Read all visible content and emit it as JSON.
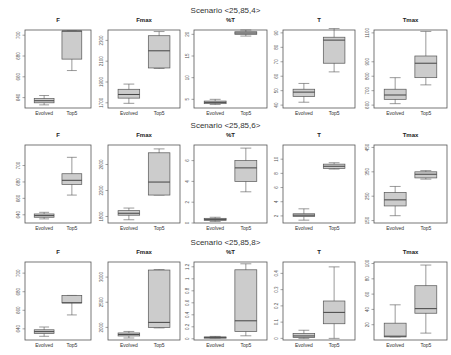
{
  "chart_data": [
    {
      "scenario": "Scenario <25,85,4>",
      "panels": [
        {
          "title": "F",
          "type": "box",
          "categories": [
            "Evolved",
            "Top5"
          ],
          "ylim": [
            630,
            705
          ],
          "yticks": [
            640,
            660,
            680,
            700
          ],
          "boxes": [
            {
              "min": 633,
              "q1": 635,
              "median": 637,
              "q3": 639,
              "max": 642
            },
            {
              "min": 666,
              "q1": 677,
              "median": 704,
              "q3": 704,
              "max": 704
            }
          ]
        },
        {
          "title": "Fmax",
          "type": "box",
          "categories": [
            "Evolved",
            "Top5"
          ],
          "ylim": [
            1650,
            2400
          ],
          "yticks": [
            1700,
            1900,
            2100,
            2300
          ],
          "boxes": [
            {
              "min": 1695,
              "q1": 1745,
              "median": 1780,
              "q3": 1830,
              "max": 1880
            },
            {
              "min": 2030,
              "q1": 2035,
              "median": 2200,
              "q3": 2345,
              "max": 2385
            }
          ]
        },
        {
          "title": "%T",
          "type": "box",
          "categories": [
            "Evolved",
            "Top5"
          ],
          "ylim": [
            3,
            21
          ],
          "yticks": [
            5,
            10,
            15,
            20
          ],
          "boxes": [
            {
              "min": 3.8,
              "q1": 4.0,
              "median": 4.3,
              "q3": 4.6,
              "max": 5.0
            },
            {
              "min": 19.6,
              "q1": 20.0,
              "median": 20.3,
              "q3": 20.6,
              "max": 21.0
            }
          ]
        },
        {
          "title": "T",
          "type": "box",
          "categories": [
            "Evolved",
            "Top5"
          ],
          "ylim": [
            38,
            92
          ],
          "yticks": [
            40,
            50,
            60,
            70,
            80,
            90
          ],
          "boxes": [
            {
              "min": 42,
              "q1": 46,
              "median": 49,
              "q3": 51,
              "max": 55
            },
            {
              "min": 63,
              "q1": 69,
              "median": 85,
              "q3": 87,
              "max": 93
            }
          ]
        },
        {
          "title": "Tmax",
          "type": "box",
          "categories": [
            "Evolved",
            "Top5"
          ],
          "ylim": [
            580,
            1120
          ],
          "yticks": [
            600,
            700,
            800,
            900,
            1100
          ],
          "boxes": [
            {
              "min": 610,
              "q1": 640,
              "median": 670,
              "q3": 710,
              "max": 790
            },
            {
              "min": 740,
              "q1": 790,
              "median": 890,
              "q3": 940,
              "max": 1110
            }
          ]
        }
      ]
    },
    {
      "scenario": "Scenario <25,85,6>",
      "panels": [
        {
          "title": "F",
          "type": "box",
          "categories": [
            "Evolved",
            "Top5"
          ],
          "ylim": [
            630,
            725
          ],
          "yticks": [
            640,
            660,
            680,
            700
          ],
          "boxes": [
            {
              "min": 635,
              "q1": 637,
              "median": 639,
              "q3": 641,
              "max": 643
            },
            {
              "min": 664,
              "q1": 677,
              "median": 682,
              "q3": 690,
              "max": 710
            }
          ]
        },
        {
          "title": "Fmax",
          "type": "box",
          "categories": [
            "Evolved",
            "Top5"
          ],
          "ylim": [
            1700,
            2900
          ],
          "yticks": [
            1800,
            2200,
            2600
          ],
          "boxes": [
            {
              "min": 1750,
              "q1": 1820,
              "median": 1850,
              "q3": 1890,
              "max": 1930
            },
            {
              "min": 2130,
              "q1": 2130,
              "median": 2330,
              "q3": 2780,
              "max": 2840
            }
          ]
        },
        {
          "title": "%T",
          "type": "box",
          "categories": [
            "Evolved",
            "Top5"
          ],
          "ylim": [
            0,
            7.5
          ],
          "yticks": [
            0,
            2,
            4,
            6
          ],
          "boxes": [
            {
              "min": 0.15,
              "q1": 0.25,
              "median": 0.35,
              "q3": 0.45,
              "max": 0.55
            },
            {
              "min": 3.0,
              "q1": 4.0,
              "median": 5.3,
              "q3": 6.0,
              "max": 7.2
            }
          ]
        },
        {
          "title": "T",
          "type": "box",
          "categories": [
            "Evolved",
            "Top5"
          ],
          "ylim": [
            1,
            12
          ],
          "yticks": [
            2,
            4,
            6,
            8,
            10
          ],
          "boxes": [
            {
              "min": 1.4,
              "q1": 1.9,
              "median": 2.1,
              "q3": 2.3,
              "max": 3.0
            },
            {
              "min": 8.6,
              "q1": 8.7,
              "median": 9.0,
              "q3": 9.3,
              "max": 9.5
            }
          ]
        },
        {
          "title": "Tmax",
          "type": "box",
          "categories": [
            "Evolved",
            "Top5"
          ],
          "ylim": [
            140,
            460
          ],
          "yticks": [
            150,
            250,
            350,
            450
          ],
          "boxes": [
            {
              "min": 170,
              "q1": 210,
              "median": 235,
              "q3": 265,
              "max": 290
            },
            {
              "min": 320,
              "q1": 325,
              "median": 340,
              "q3": 350,
              "max": 355
            }
          ]
        }
      ]
    },
    {
      "scenario": "Scenario <25,85,8>",
      "panels": [
        {
          "title": "F",
          "type": "box",
          "categories": [
            "Evolved",
            "Top5"
          ],
          "ylim": [
            628,
            712
          ],
          "yticks": [
            640,
            660,
            680,
            700
          ],
          "boxes": [
            {
              "min": 632,
              "q1": 635,
              "median": 637,
              "q3": 639,
              "max": 642
            },
            {
              "min": 655,
              "q1": 668,
              "median": 668,
              "q3": 676,
              "max": 676
            }
          ]
        },
        {
          "title": "Fmax",
          "type": "box",
          "categories": [
            "Evolved",
            "Top5"
          ],
          "ylim": [
            1750,
            3300
          ],
          "yticks": [
            2000,
            2500,
            3000
          ],
          "boxes": [
            {
              "min": 1790,
              "q1": 1830,
              "median": 1860,
              "q3": 1890,
              "max": 1920
            },
            {
              "min": 1990,
              "q1": 2000,
              "median": 2100,
              "q3": 3140,
              "max": 3150
            }
          ]
        },
        {
          "title": "%T",
          "type": "box",
          "categories": [
            "Evolved",
            "Top5"
          ],
          "ylim": [
            -0.02,
            1.28
          ],
          "yticks": [
            0.0,
            0.2,
            0.4,
            0.6,
            0.8,
            1.0,
            1.2
          ],
          "boxes": [
            {
              "min": 0.01,
              "q1": 0.02,
              "median": 0.025,
              "q3": 0.03,
              "max": 0.04
            },
            {
              "min": 0.05,
              "q1": 0.12,
              "median": 0.3,
              "q3": 1.15,
              "max": 1.25
            }
          ]
        },
        {
          "title": "T",
          "type": "box",
          "categories": [
            "Evolved",
            "Top5"
          ],
          "ylim": [
            -0.01,
            0.47
          ],
          "yticks": [
            0.0,
            0.1,
            0.2,
            0.3,
            0.4
          ],
          "boxes": [
            {
              "min": 0.0,
              "q1": 0.005,
              "median": 0.015,
              "q3": 0.03,
              "max": 0.05
            },
            {
              "min": 0.0,
              "q1": 0.09,
              "median": 0.16,
              "q3": 0.23,
              "max": 0.44
            }
          ]
        },
        {
          "title": "Tmax",
          "type": "box",
          "categories": [
            "Evolved",
            "Top5"
          ],
          "ylim": [
            0,
            102
          ],
          "yticks": [
            20,
            40,
            60,
            80,
            100
          ],
          "boxes": [
            {
              "min": 4,
              "q1": 4,
              "median": 5,
              "q3": 22,
              "max": 46
            },
            {
              "min": 9,
              "q1": 35,
              "median": 41,
              "q3": 71,
              "max": 98
            }
          ]
        }
      ]
    }
  ],
  "style": {
    "box_fill": "#cccccc",
    "stroke": "#555555",
    "frame": "#555555"
  },
  "labels": {
    "x_categories": [
      "Evolved",
      "Top5"
    ]
  }
}
